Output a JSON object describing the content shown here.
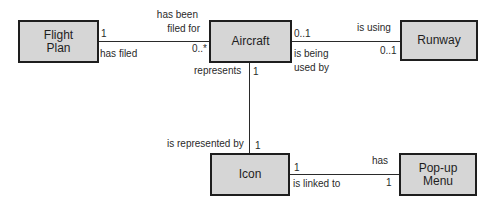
{
  "diagram": {
    "type": "uml-class-association",
    "entities": [
      {
        "id": "flight_plan",
        "label_line1": "Flight",
        "label_line2": "Plan"
      },
      {
        "id": "aircraft",
        "label": "Aircraft"
      },
      {
        "id": "runway",
        "label": "Runway"
      },
      {
        "id": "icon",
        "label": "Icon"
      },
      {
        "id": "popup_menu",
        "label_line1": "Pop-up",
        "label_line2": "Menu"
      }
    ],
    "associations": [
      {
        "from": "flight_plan",
        "to": "aircraft",
        "from_multiplicity": "1",
        "to_multiplicity": "0..*",
        "label_above_line1": "has been",
        "label_above_line2": "filed for",
        "label_below": "has filed"
      },
      {
        "from": "aircraft",
        "to": "runway",
        "from_multiplicity": "0..1",
        "to_multiplicity": "0..1",
        "label_above": "is using",
        "label_below_line1": "is being",
        "label_below_line2": "used by"
      },
      {
        "from": "aircraft",
        "to": "icon",
        "from_multiplicity": "1",
        "to_multiplicity": "1",
        "label_top": "represents",
        "label_bottom": "is represented by"
      },
      {
        "from": "icon",
        "to": "popup_menu",
        "from_multiplicity": "1",
        "to_multiplicity": "1",
        "label_above": "has",
        "label_below": "is linked to"
      }
    ]
  },
  "colors": {
    "box_fill": "#d6d6d6",
    "stroke": "#1e1e1e",
    "background": "#ffffff"
  }
}
